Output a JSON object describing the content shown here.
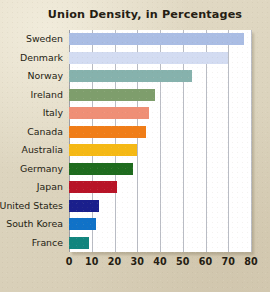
{
  "figure": {
    "background_color": "#ded6c0",
    "plot_background_color": "#ffffff",
    "text_color": "#241c12",
    "gridline_color": "#b9bcc4"
  },
  "chart_data": {
    "type": "bar",
    "orientation": "horizontal",
    "title": "Union Density, in Percentages",
    "xlabel": "",
    "ylabel": "",
    "xlim": [
      0,
      80
    ],
    "ylim": null,
    "grid": true,
    "legend": "none",
    "xticks": [
      0,
      10,
      20,
      30,
      40,
      50,
      60,
      70,
      80
    ],
    "xtick_labels": [
      "0",
      "10",
      "20",
      "30",
      "40",
      "50",
      "60",
      "70",
      "80"
    ],
    "categories": [
      "Sweden",
      "Denmark",
      "Norway",
      "Ireland",
      "Italy",
      "Canada",
      "Australia",
      "Germany",
      "Japan",
      "United States",
      "South Korea",
      "France"
    ],
    "values": [
      77,
      70,
      54,
      38,
      35,
      34,
      30,
      28,
      21,
      13,
      12,
      9
    ],
    "colors": [
      "#aabde4",
      "#d3dcf2",
      "#86b2ad",
      "#7e9e6c",
      "#ef8f76",
      "#f07d17",
      "#f5b915",
      "#1e6b1e",
      "#b81427",
      "#1a1f8c",
      "#1072c8",
      "#11857e"
    ],
    "series": [
      {
        "name": "Union Density",
        "values": [
          77,
          70,
          54,
          38,
          35,
          34,
          30,
          28,
          21,
          13,
          12,
          9
        ]
      }
    ]
  }
}
